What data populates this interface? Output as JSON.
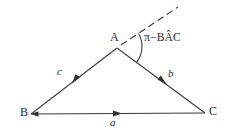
{
  "figure": {
    "type": "geometry-diagram",
    "background_color": "#ffffff",
    "stroke_color": "#3a3a3a",
    "text_color": "#2b2b2b",
    "width": 231,
    "height": 133
  },
  "vertices": [
    {
      "id": "A",
      "label": "A",
      "x": 117,
      "y": 48
    },
    {
      "id": "B",
      "label": "B",
      "x": 31,
      "y": 114
    },
    {
      "id": "C",
      "label": "C",
      "x": 205,
      "y": 113
    }
  ],
  "edges": [
    {
      "id": "c",
      "label": "c",
      "from": "B",
      "to": "A",
      "arrow": "toward-A"
    },
    {
      "id": "b",
      "label": "b",
      "from": "A",
      "to": "C",
      "arrow": "toward-C"
    },
    {
      "id": "a",
      "label": "a",
      "from": "B",
      "to": "C",
      "arrow": "toward-C"
    }
  ],
  "dashed_ray": {
    "id": "exterior-ray",
    "from": "A",
    "to_x": 178,
    "to_y": 7,
    "style": "dashed"
  },
  "angle": {
    "id": "exterior-angle-at-A",
    "label": "π−BÂC",
    "label_plain": "π − BAC",
    "arc_at": "A",
    "between": [
      "exterior-ray",
      "b"
    ]
  }
}
